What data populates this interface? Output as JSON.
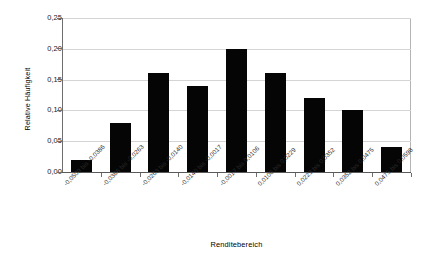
{
  "chart_data": {
    "type": "bar",
    "title": "",
    "xlabel": "Renditebereich",
    "ylabel": "Relative Häufigkeit",
    "categories": [
      "-0,0509 bis -0,0386",
      "-0,0386 bis -0,0263",
      "-0,0263 bis -0,0140",
      "-0,0140 bis -0,0017",
      "-0,0017 bis 0,0106",
      "0,0106 bis 0,0229",
      "0,0229 bis 0,0352",
      "0,0352 bis 0,0475",
      "0,0475 bis 0,0598"
    ],
    "values": [
      0.02,
      0.08,
      0.16,
      0.14,
      0.2,
      0.16,
      0.12,
      0.1,
      0.04
    ],
    "ylim": [
      0.0,
      0.25
    ],
    "ytick_labels": [
      "0,00",
      "0,05",
      "0,10",
      "0,15",
      "0,20",
      "0,25"
    ],
    "ytick_values": [
      0.0,
      0.05,
      0.1,
      0.15,
      0.2,
      0.25
    ],
    "grid": "horizontal",
    "legend": "none",
    "bar_color": "#050505",
    "grid_color": "#d4d4d4",
    "axis_color": "#6e6e6e",
    "background": "#ffffff"
  }
}
